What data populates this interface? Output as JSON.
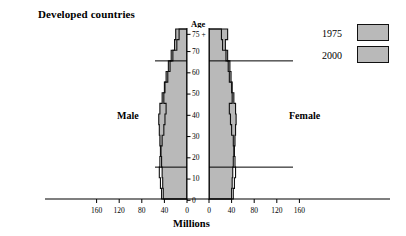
{
  "chart": {
    "title": "Developed countries",
    "age_axis_title": "Age",
    "x_axis_title": "Millions",
    "male_label": "Male",
    "female_label": "Female"
  },
  "legend": {
    "position": "top-right",
    "items": [
      {
        "label": "1975",
        "swatch_color": "#b9b9b9"
      },
      {
        "label": "2000",
        "swatch_color": "#b9b9b9"
      }
    ]
  },
  "axes": {
    "age_ticks": [
      "0",
      "10",
      "20",
      "30",
      "40",
      "50",
      "60",
      "70",
      "75 +"
    ],
    "left_ticks": [
      "160",
      "120",
      "80",
      "40",
      "0"
    ],
    "right_ticks": [
      "0",
      "40",
      "80",
      "120",
      "160"
    ],
    "x_max": 160,
    "reference_lines_age": [
      15,
      65
    ]
  },
  "colors": {
    "fill": "#b9b9b9",
    "outline": "#111111",
    "axis": "#000000",
    "background": "#ffffff"
  },
  "chart_data": {
    "type": "bar",
    "orientation": "population-pyramid",
    "title": "Developed countries",
    "xlabel": "Millions",
    "ylabel": "Age",
    "xlim": [
      -160,
      160
    ],
    "grid": false,
    "legend_position": "top-right",
    "categories": [
      "0-4",
      "5-9",
      "10-14",
      "15-19",
      "20-24",
      "25-29",
      "30-34",
      "35-39",
      "40-44",
      "45-49",
      "50-54",
      "55-59",
      "60-64",
      "65-69",
      "70-74",
      "75+"
    ],
    "series": [
      {
        "name": "2000",
        "side": "male",
        "values": [
          42,
          43,
          44,
          45,
          47,
          48,
          49,
          50,
          48,
          44,
          40,
          37,
          33,
          28,
          22,
          20
        ]
      },
      {
        "name": "2000",
        "side": "female",
        "values": [
          40,
          41,
          42,
          43,
          45,
          46,
          47,
          48,
          47,
          44,
          41,
          39,
          37,
          33,
          29,
          33
        ]
      },
      {
        "name": "1975",
        "side": "male",
        "values": [
          45,
          47,
          49,
          48,
          46,
          44,
          41,
          39,
          37,
          41,
          39,
          34,
          30,
          25,
          18,
          14
        ]
      },
      {
        "name": "1975",
        "side": "female",
        "values": [
          43,
          45,
          47,
          46,
          44,
          43,
          40,
          38,
          36,
          41,
          40,
          36,
          34,
          30,
          24,
          22
        ]
      }
    ]
  }
}
